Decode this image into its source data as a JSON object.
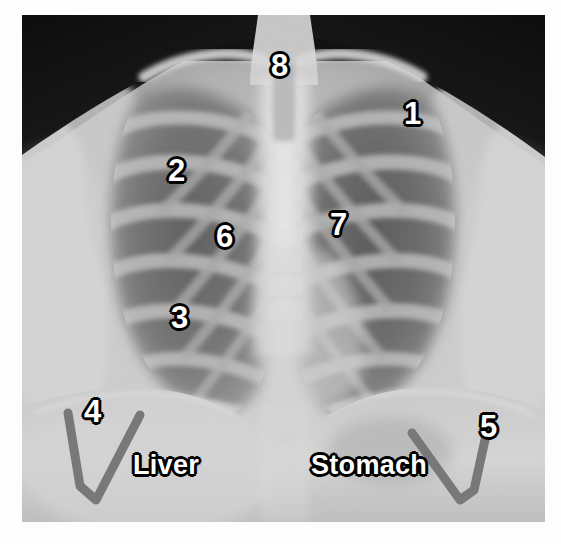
{
  "figure": {
    "kind": "annotated-chest-radiograph",
    "view": "frontal PA chest x-ray",
    "border_color": "#ffffff",
    "plate_background": "#0a0a0a"
  },
  "annotation_style": {
    "label_fill": "#ffffff",
    "label_outline": "#000000",
    "arrow_color": "#787878",
    "arrow_stroke_width": 9
  },
  "markers": [
    {
      "id": "marker-1",
      "label": "1",
      "x": 404,
      "y": 98,
      "kind": "number"
    },
    {
      "id": "marker-2",
      "label": "2",
      "x": 168,
      "y": 155,
      "kind": "number"
    },
    {
      "id": "marker-3",
      "label": "3",
      "x": 171,
      "y": 302,
      "kind": "number"
    },
    {
      "id": "marker-4",
      "label": "4",
      "x": 84,
      "y": 396,
      "kind": "number"
    },
    {
      "id": "marker-5",
      "label": "5",
      "x": 480,
      "y": 411,
      "kind": "number"
    },
    {
      "id": "marker-6",
      "label": "6",
      "x": 216,
      "y": 221,
      "kind": "number"
    },
    {
      "id": "marker-7",
      "label": "7",
      "x": 330,
      "y": 209,
      "kind": "number"
    },
    {
      "id": "marker-8",
      "label": "8",
      "x": 271,
      "y": 50,
      "kind": "number"
    }
  ],
  "organ_labels": [
    {
      "id": "label-liver",
      "label": "Liver",
      "x": 133,
      "y": 452
    },
    {
      "id": "label-stomach",
      "label": "Stomach",
      "x": 311,
      "y": 452
    }
  ],
  "arrows": [
    {
      "id": "arrow-liver-diaphragm",
      "points": "68,413 80,486 96,500 140,415",
      "description": "v-shaped marker under right hemidiaphragm"
    },
    {
      "id": "arrow-stomach-diaphragm",
      "points": "412,433 460,500 474,490 490,417",
      "description": "v-shaped marker under left hemidiaphragm"
    }
  ],
  "chart_data": {
    "type": "annotated-image",
    "marker_count": 8,
    "text_labels": [
      "1",
      "2",
      "3",
      "4",
      "5",
      "6",
      "7",
      "8",
      "Liver",
      "Stomach"
    ]
  }
}
